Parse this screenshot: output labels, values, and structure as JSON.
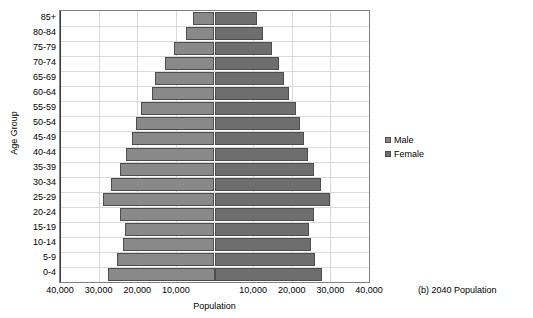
{
  "chart_data": {
    "type": "bar",
    "subtype": "population-pyramid",
    "title": "",
    "caption": "(b) 2040 Population",
    "xlabel": "Population",
    "ylabel": "Age Group",
    "grid": true,
    "legend_position": "right",
    "axis_max": 40000,
    "xtick_values": [
      -40000,
      -30000,
      -20000,
      -10000,
      10000,
      20000,
      30000,
      40000
    ],
    "xtick_labels": [
      "40,000",
      "30,000",
      "20,000",
      "10,000",
      "10,000",
      "20,000",
      "30,000",
      "40,000"
    ],
    "categories": [
      "85+",
      "80-84",
      "75-79",
      "70-74",
      "65-69",
      "60-64",
      "55-59",
      "50-54",
      "45-49",
      "40-44",
      "35-39",
      "30-34",
      "25-29",
      "20-24",
      "15-19",
      "10-14",
      "5-9",
      "0-4"
    ],
    "series": [
      {
        "name": "Male",
        "color": "#898989",
        "values": [
          5600,
          7400,
          10600,
          12900,
          15300,
          16300,
          19000,
          20300,
          21300,
          22800,
          24500,
          26800,
          28800,
          24500,
          23200,
          23700,
          25200,
          27500
        ]
      },
      {
        "name": "Female",
        "color": "#6e6e6e",
        "values": [
          11000,
          12500,
          14800,
          16600,
          18100,
          19300,
          21100,
          22200,
          23100,
          24200,
          25800,
          27600,
          29800,
          25800,
          24500,
          25000,
          26000,
          27800
        ]
      }
    ]
  },
  "legend": {
    "items": [
      {
        "label": "Male",
        "key": "male"
      },
      {
        "label": "Female",
        "key": "female"
      }
    ]
  }
}
